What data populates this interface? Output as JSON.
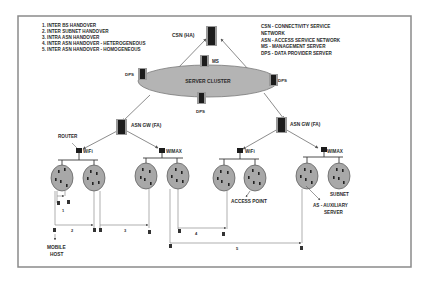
{
  "legend_handovers": {
    "items": [
      "1. INTER BS HANDOVER",
      "2. INTER SUBNET HANDOVER",
      "3. INTRA ASN HANDOVER",
      "4. INTER ASN HANDOVER - HETEROGENEOUS",
      "5. INTER ASN HANDOVER - HOMOGENEOUS"
    ]
  },
  "legend_abbrev": {
    "items": [
      "CSN - CONNECTIVITY SERVICE",
      "NETWORK",
      "ASN - ACCESS SERVICE NETWORK",
      "MS - MANAGEMENT SERVER",
      "DPS - DATA PROVIDER SERVER"
    ]
  },
  "nodes": {
    "csn": "CSN  (HA)",
    "server_cluster": "SERVER CLUSTER",
    "ms": "MS",
    "dps_left": "DPS",
    "dps_right": "DPS",
    "dps_bottom": "DPS",
    "asn_gw_left": "ASN GW (FA)",
    "asn_gw_right": "ASN GW (FA)",
    "router": "ROUTER",
    "wifi_left": "WiFi",
    "wimax_left": "WIMAX",
    "wifi_right": "WiFi",
    "wimax_right": "WIMAX"
  },
  "annotations": {
    "access_point": "ACCESS POINT",
    "subnet": "SUBNET",
    "as_line1": "AS - AUXILIARY",
    "as_line2": "SERVER",
    "mobile_host_line1": "MOBILE",
    "mobile_host_line2": "HOST"
  },
  "handover_labels": {
    "h1": "1",
    "h2": "2",
    "h3": "3",
    "h4": "4",
    "h5": "5"
  },
  "colors": {
    "cluster_fill": "#b4b4b4",
    "subnet_fill": "#a8a8a8",
    "server_dark": "#1c1c1c",
    "server_halo": "#9a9a9a",
    "line": "#6e6e6e",
    "text": "#2a2a2a",
    "frame": "#8a8a8a"
  }
}
